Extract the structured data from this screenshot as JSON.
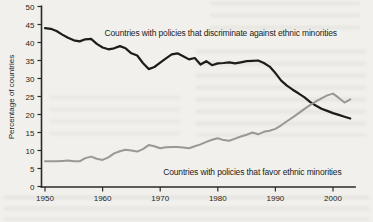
{
  "figure": {
    "background_color": "#f1f0ec",
    "axis_color": "#2b2a27",
    "text_color": "#262522"
  },
  "chart_data": {
    "type": "line",
    "title": "",
    "xlabel": "",
    "ylabel": "Percentage of countries",
    "xlim": [
      1950,
      2003.8
    ],
    "ylim": [
      0,
      50
    ],
    "x_ticks": [
      1950,
      1960,
      1970,
      1980,
      1990,
      2000
    ],
    "y_ticks": [
      0,
      5,
      10,
      15,
      20,
      25,
      30,
      35,
      40,
      45,
      50
    ],
    "grid": false,
    "legend_position": "inline-annotations",
    "x": [
      1950,
      1951,
      1952,
      1953,
      1954,
      1955,
      1956,
      1957,
      1958,
      1959,
      1960,
      1961,
      1962,
      1963,
      1964,
      1965,
      1966,
      1967,
      1968,
      1969,
      1970,
      1971,
      1972,
      1973,
      1974,
      1975,
      1976,
      1977,
      1978,
      1979,
      1980,
      1981,
      1982,
      1983,
      1984,
      1985,
      1986,
      1987,
      1988,
      1989,
      1990,
      1991,
      1992,
      1993,
      1994,
      1995,
      1996,
      1997,
      1998,
      1999,
      2000,
      2001,
      2002,
      2003
    ],
    "series": [
      {
        "name": "discriminate",
        "label": "Countries with policies that discriminate against ethnic minorities",
        "color": "#1d1c1a",
        "stroke_width": 2.2,
        "values": [
          44.0,
          43.8,
          43.2,
          42.2,
          41.3,
          40.6,
          40.3,
          40.9,
          41.0,
          39.6,
          38.6,
          38.1,
          38.4,
          39.0,
          38.4,
          37.0,
          36.4,
          34.3,
          32.6,
          33.2,
          34.4,
          35.6,
          36.7,
          37.0,
          36.2,
          35.3,
          35.7,
          33.9,
          34.8,
          33.7,
          34.2,
          34.3,
          34.5,
          34.2,
          34.5,
          34.8,
          34.9,
          35.0,
          34.3,
          33.3,
          31.5,
          29.4,
          28.0,
          26.9,
          25.9,
          24.8,
          23.5,
          22.5,
          21.6,
          21.0,
          20.4,
          19.9,
          19.4,
          18.9
        ]
      },
      {
        "name": "favor",
        "label": "Countries with policies that favor ethnic minorities",
        "color": "#9a9892",
        "stroke_width": 2.0,
        "values": [
          7.0,
          7.0,
          7.0,
          7.1,
          7.2,
          7.0,
          7.0,
          7.9,
          8.3,
          7.7,
          7.4,
          8.1,
          9.2,
          9.8,
          10.2,
          10.0,
          9.7,
          10.4,
          11.5,
          11.2,
          10.6,
          10.9,
          11.0,
          11.0,
          10.8,
          10.6,
          11.2,
          11.7,
          12.4,
          13.0,
          13.4,
          12.9,
          12.7,
          13.3,
          13.9,
          14.4,
          15.0,
          14.5,
          15.2,
          15.5,
          16.0,
          17.0,
          18.1,
          19.2,
          20.3,
          21.5,
          22.6,
          23.6,
          24.5,
          25.3,
          25.8,
          24.6,
          23.3,
          24.2
        ]
      }
    ],
    "annotations": [
      {
        "series": "discriminate",
        "x": 1980.5,
        "y": 42.6,
        "anchor": "middle"
      },
      {
        "series": "favor",
        "x": 1986.0,
        "y": 4.0,
        "anchor": "middle"
      }
    ]
  }
}
